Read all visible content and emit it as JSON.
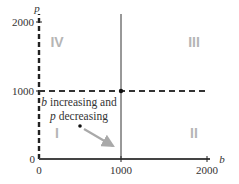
{
  "diagram": {
    "axes": {
      "x_label": "b",
      "y_label": "p",
      "x_ticks": [
        "0",
        "1000",
        "2000"
      ],
      "y_ticks": [
        "0",
        "1000",
        "2000"
      ]
    },
    "quadrants": {
      "top_left": "IV",
      "top_right": "III",
      "bottom_left": "I",
      "bottom_right": "II"
    },
    "annotation": {
      "line1_var": "b",
      "line1_rest": " increasing and",
      "line2_var": "p",
      "line2_rest": " decreasing"
    },
    "colors": {
      "axis": "#333333",
      "quadrant_label": "#b5b5b5",
      "arrow": "#a9a9a9"
    }
  }
}
